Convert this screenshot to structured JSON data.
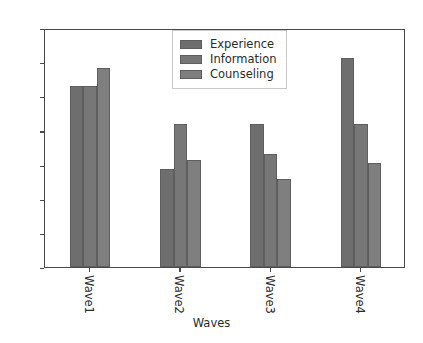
{
  "chart_data": {
    "type": "bar",
    "title": "",
    "xlabel": "Waves",
    "ylabel": "",
    "categories": [
      "Wave1",
      "Wave2",
      "Wave3",
      "Wave4"
    ],
    "series": [
      {
        "name": "Experience",
        "color": "#6e6e6e",
        "values": [
          265,
          143,
          210,
          306
        ]
      },
      {
        "name": "Information",
        "color": "#777777",
        "values": [
          265,
          209,
          166,
          209
        ]
      },
      {
        "name": "Counseling",
        "color": "#7f7f7f",
        "values": [
          291,
          157,
          129,
          152
        ]
      }
    ],
    "ylim": [
      0,
      350
    ],
    "yticks": [
      0,
      50,
      100,
      150,
      200,
      250,
      300,
      350
    ],
    "ytick_labels": [
      "0",
      "50",
      "100",
      "150",
      "200",
      "250",
      "300",
      "350"
    ],
    "xtick_label_rotation": 90,
    "grid": false,
    "legend_position": "upper center-left",
    "axis_color": "#4a4a4a",
    "background_color": "#ffffff",
    "text_color": "#2b2b2b"
  }
}
